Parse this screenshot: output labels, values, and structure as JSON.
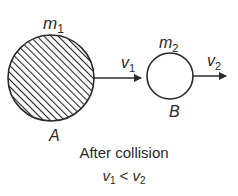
{
  "diagram": {
    "title": "After collision",
    "condition": {
      "left": "v",
      "left_sub": "1",
      "op": " < ",
      "right": "v",
      "right_sub": "2"
    },
    "bodies": [
      {
        "id": "A",
        "label": "A",
        "mass": "m",
        "mass_sub": "1",
        "fill": "hatched",
        "velocity": "v",
        "velocity_sub": "1"
      },
      {
        "id": "B",
        "label": "B",
        "mass": "m",
        "mass_sub": "2",
        "fill": "empty",
        "velocity": "v",
        "velocity_sub": "2"
      }
    ],
    "colors": {
      "stroke": "#2a2a2a",
      "background": "#ffffff"
    }
  }
}
